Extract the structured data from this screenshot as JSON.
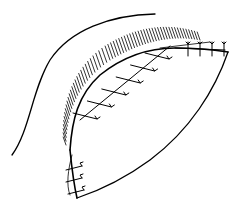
{
  "figure": {
    "type": "line-art illustration",
    "colors": {
      "background": "#ffffff",
      "ink": "#000000"
    },
    "elements": {
      "outer_contour": "curved outline upper-left",
      "hatched_band": "shaded arc along upper wound edge",
      "flap_outline": "leaf-shaped flap",
      "suture_line": "row of interrupted sutures along the flap edge",
      "suture_count_diagonal": 6,
      "suture_count_top_right": 4,
      "suture_count_bottom_left": 3
    }
  }
}
